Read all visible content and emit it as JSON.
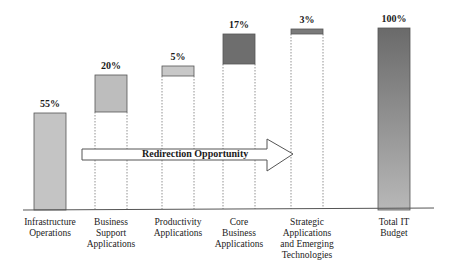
{
  "chart_data": {
    "type": "bar",
    "subtype": "waterfall",
    "title": "",
    "xlabel": "",
    "ylabel": "",
    "ylim": [
      0,
      100
    ],
    "grid": false,
    "legend": null,
    "categories": [
      "Infrastructure Operations",
      "Business Support Applications",
      "Productivity Applications",
      "Core Business Applications",
      "Strategic Applications and Emerging Technologies",
      "Total IT Budget"
    ],
    "values": [
      55,
      20,
      5,
      17,
      3,
      100
    ],
    "value_labels": [
      "55%",
      "20%",
      "5%",
      "17%",
      "3%",
      "100%"
    ],
    "bases": [
      0,
      55,
      75,
      80,
      97,
      0
    ],
    "annotations": [
      {
        "type": "arrow",
        "text": "Redirection Opportunity",
        "from": "Business Support Applications",
        "to": "Strategic Applications and Emerging Technologies"
      }
    ]
  },
  "bars": [
    {
      "label": "55%",
      "x": 34,
      "top": 113,
      "bottom": 210,
      "fill": "#c4c4c4",
      "lines": [
        "Infrastructure",
        "Operations"
      ]
    },
    {
      "label": "20%",
      "x": 95,
      "top": 75,
      "bottom": 112,
      "fill": "#bdbdbd",
      "lines": [
        "Business",
        "Support",
        "Applications"
      ]
    },
    {
      "label": "5%",
      "x": 162,
      "top": 66,
      "bottom": 76,
      "fill": "#c8c8c8",
      "lines": [
        "Productivity",
        "Applications"
      ]
    },
    {
      "label": "17%",
      "x": 223,
      "top": 34,
      "bottom": 64,
      "fill": "#6e6e6e",
      "lines": [
        "Core",
        "Business",
        "Applications"
      ]
    },
    {
      "label": "3%",
      "x": 291,
      "top": 29,
      "bottom": 34,
      "fill": "#7a7a7a",
      "lines": [
        "Strategic",
        "Applications",
        "and Emerging",
        "Technologies"
      ]
    },
    {
      "label": "100%",
      "x": 378,
      "top": 28,
      "bottom": 210,
      "fill": "url(#totalGrad)",
      "lines": [
        "Total IT",
        "Budget"
      ]
    }
  ],
  "arrow": {
    "text": "Redirection Opportunity"
  },
  "colors": {
    "light": "#c4c4c4",
    "dark": "#6e6e6e",
    "total_top": "#6a6a6a",
    "total_bottom": "#b8b8b8",
    "axis": "#555555"
  }
}
